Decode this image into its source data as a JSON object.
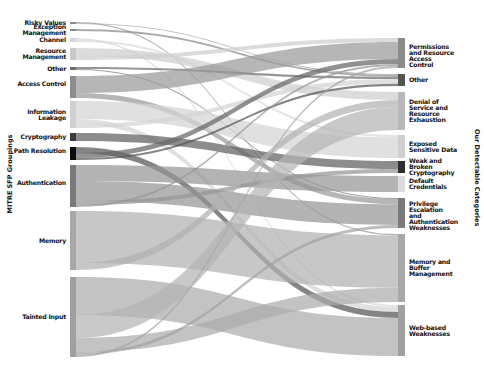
{
  "diagram": {
    "type": "sankey",
    "left_axis_title": "MITRE SFP Groupings",
    "right_axis_title": "Our Detectable Categories",
    "left_nodes": [
      {
        "id": "risky",
        "label": "Risky Values",
        "y0": 22,
        "y1": 24,
        "color": "#8a8a8a"
      },
      {
        "id": "exception",
        "label": "Exception Management",
        "y0": 29,
        "y1": 31,
        "color": "#8a8a8a"
      },
      {
        "id": "channel",
        "label": "Channel",
        "y0": 38,
        "y1": 42,
        "color": "#d6d6d6"
      },
      {
        "id": "resource",
        "label": "Resource Management",
        "y0": 48,
        "y1": 60,
        "color": "#c8c8c8"
      },
      {
        "id": "other",
        "label": "Other",
        "y0": 67,
        "y1": 70,
        "color": "#6e6e6e"
      },
      {
        "id": "access",
        "label": "Access Control",
        "y0": 76,
        "y1": 98,
        "color": "#8c8c8c"
      },
      {
        "id": "infoleak",
        "label": "Information Leakage",
        "y0": 101,
        "y1": 128,
        "color": "#cfcfcf"
      },
      {
        "id": "crypto",
        "label": "Cryptography",
        "y0": 133,
        "y1": 141,
        "color": "#3a3a3a"
      },
      {
        "id": "path",
        "label": "Path Resolution",
        "y0": 147,
        "y1": 160,
        "color": "#0a0a0a"
      },
      {
        "id": "auth",
        "label": "Authentication",
        "y0": 165,
        "y1": 207,
        "color": "#7a7a7a"
      },
      {
        "id": "memory",
        "label": "Memory",
        "y0": 211,
        "y1": 270,
        "color": "#a8a8a8"
      },
      {
        "id": "tainted",
        "label": "Tainted Input",
        "y0": 277,
        "y1": 357,
        "color": "#a0a0a0"
      }
    ],
    "right_nodes": [
      {
        "id": "perm",
        "label": "Permissions and Resource Access Control",
        "y0": 38,
        "y1": 68,
        "color": "#8c8c8c"
      },
      {
        "id": "rother",
        "label": "Other",
        "y0": 74,
        "y1": 86,
        "color": "#555555"
      },
      {
        "id": "dos",
        "label": "Denial of Service and Resource Exhaustion",
        "y0": 92,
        "y1": 130,
        "color": "#b8b8b8"
      },
      {
        "id": "exposed",
        "label": "Exposed Sensitive Data",
        "y0": 135,
        "y1": 158,
        "color": "#cfcfcf"
      },
      {
        "id": "weak",
        "label": "Weak and Broken Cryptography",
        "y0": 161,
        "y1": 173,
        "color": "#2e2e2e"
      },
      {
        "id": "default",
        "label": "Default Credentials",
        "y0": 176,
        "y1": 192,
        "color": "#dcdcdc"
      },
      {
        "id": "priv",
        "label": "Privilege Escalation and Authentication Weaknesses",
        "y0": 198,
        "y1": 228,
        "color": "#7a7a7a"
      },
      {
        "id": "membuf",
        "label": "Memory and Buffer Management",
        "y0": 234,
        "y1": 302,
        "color": "#a8a8a8"
      },
      {
        "id": "web",
        "label": "Web-based Weaknesses",
        "y0": 305,
        "y1": 356,
        "color": "#a0a0a0"
      }
    ],
    "flows": [
      {
        "from": "risky",
        "to": "membuf",
        "w": 1.2,
        "color": "#9a9a9a"
      },
      {
        "from": "risky",
        "to": "rother",
        "w": 0.8,
        "color": "#9a9a9a"
      },
      {
        "from": "exception",
        "to": "rother",
        "w": 1.5,
        "color": "#8a8a8a"
      },
      {
        "from": "channel",
        "to": "web",
        "w": 2,
        "color": "#dadada"
      },
      {
        "from": "channel",
        "to": "exposed",
        "w": 2,
        "color": "#dadada"
      },
      {
        "from": "resource",
        "to": "dos",
        "w": 8,
        "color": "#cfcfcf"
      },
      {
        "from": "resource",
        "to": "perm",
        "w": 4,
        "color": "#cfcfcf"
      },
      {
        "from": "other",
        "to": "rother",
        "w": 2,
        "color": "#6e6e6e"
      },
      {
        "from": "other",
        "to": "priv",
        "w": 1,
        "color": "#7a7a7a"
      },
      {
        "from": "access",
        "to": "perm",
        "w": 17,
        "color": "#9a9a9a"
      },
      {
        "from": "access",
        "to": "priv",
        "w": 5,
        "color": "#9a9a9a"
      },
      {
        "from": "infoleak",
        "to": "exposed",
        "w": 18,
        "color": "#d4d4d4"
      },
      {
        "from": "infoleak",
        "to": "web",
        "w": 5,
        "color": "#d4d4d4"
      },
      {
        "from": "infoleak",
        "to": "rother",
        "w": 4,
        "color": "#d4d4d4"
      },
      {
        "from": "crypto",
        "to": "weak",
        "w": 8,
        "color": "#606060"
      },
      {
        "from": "path",
        "to": "web",
        "w": 6,
        "color": "#555555"
      },
      {
        "from": "path",
        "to": "perm",
        "w": 5,
        "color": "#666666"
      },
      {
        "from": "path",
        "to": "rother",
        "w": 2,
        "color": "#555555"
      },
      {
        "from": "auth",
        "to": "default",
        "w": 16,
        "color": "#959595"
      },
      {
        "from": "auth",
        "to": "priv",
        "w": 20,
        "color": "#959595"
      },
      {
        "from": "auth",
        "to": "weak",
        "w": 4,
        "color": "#959595"
      },
      {
        "from": "auth",
        "to": "perm",
        "w": 2,
        "color": "#959595"
      },
      {
        "from": "memory",
        "to": "membuf",
        "w": 52,
        "color": "#b2b2b2"
      },
      {
        "from": "memory",
        "to": "dos",
        "w": 7,
        "color": "#b2b2b2"
      },
      {
        "from": "tainted",
        "to": "web",
        "w": 38,
        "color": "#acacac"
      },
      {
        "from": "tainted",
        "to": "dos",
        "w": 23,
        "color": "#b4b4b4"
      },
      {
        "from": "tainted",
        "to": "membuf",
        "w": 14,
        "color": "#acacac"
      },
      {
        "from": "tainted",
        "to": "priv",
        "w": 3,
        "color": "#a4a4a4"
      },
      {
        "from": "tainted",
        "to": "perm",
        "w": 2,
        "color": "#a4a4a4"
      }
    ],
    "layout": {
      "left_x0": 70,
      "left_x1": 76,
      "right_x0": 398,
      "right_x1": 405
    }
  }
}
